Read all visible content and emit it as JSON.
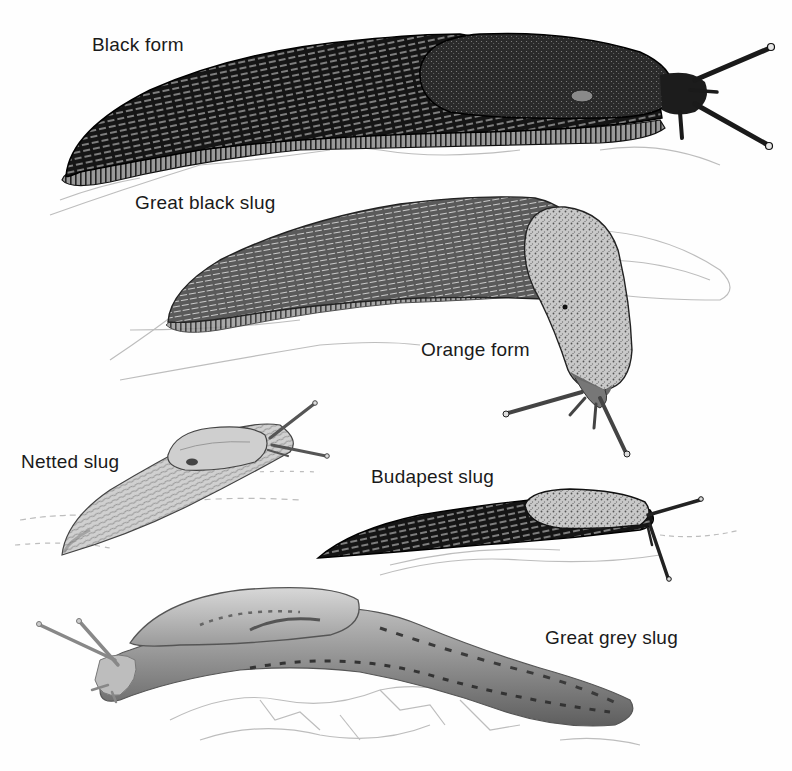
{
  "plate": {
    "subject": "Slug species illustration plate",
    "labels": {
      "black_form": "Black form",
      "great_black_slug": "Great black slug",
      "orange_form": "Orange form",
      "netted_slug": "Netted slug",
      "budapest_slug": "Budapest slug",
      "great_grey_slug": "Great grey slug"
    },
    "colors": {
      "background": "#fefefe",
      "ink": "#111111",
      "label_text": "#1a1a1a",
      "ground_sketch": "#b8b8b8"
    }
  }
}
